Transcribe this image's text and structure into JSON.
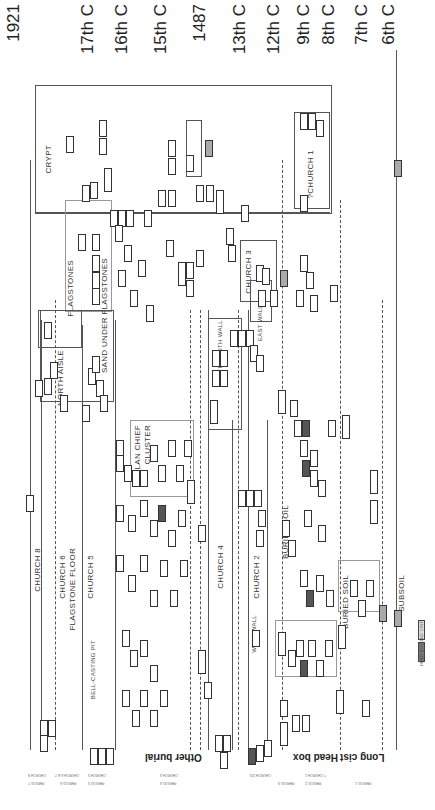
{
  "diagram": {
    "type": "harris-matrix-stratigraphic",
    "orientation": "rotated-90"
  },
  "date_axis": [
    {
      "label": "1921",
      "x": 12
    },
    {
      "label": "17th C",
      "x": 84
    },
    {
      "label": "16th C",
      "x": 118
    },
    {
      "label": "15th C",
      "x": 157
    },
    {
      "label": "1487",
      "x": 196
    },
    {
      "label": "13th C",
      "x": 236
    },
    {
      "label": "12th C",
      "x": 270
    },
    {
      "label": "9th C",
      "x": 300
    },
    {
      "label": "8th C",
      "x": 325
    },
    {
      "label": "7th C",
      "x": 358
    },
    {
      "label": "6th C",
      "x": 385
    }
  ],
  "phases": {
    "crypt": "CRYPT",
    "church1": "?CHURCH 1",
    "church2": "CHURCH 2",
    "church3": "CHURCH 3",
    "church4": "CHURCH 4",
    "church5": "CHURCH 5",
    "church6": "CHURCH 6",
    "church8": "CHURCH 8",
    "flagstone_floor": "FLAGSTONE FLOOR",
    "flagstones": "FLAGSTONES",
    "sand_under_flagstones": "SAND UNDER FLAGSTONES",
    "north_aisle": "NORTH AISLE",
    "clan_chief_cluster_1": "CLAN CHIEF",
    "clan_chief_cluster_2": "CLUSTER",
    "buried_soil": "BURIED SOIL",
    "buried_soil_2": "BURIED SOIL",
    "subsoil": "SUBSOIL",
    "bell_casting_pit": "BELL-CASTING PIT",
    "west_wall": "WEST WALL",
    "north_south_wall": "NORTH SOUTH WALL",
    "east_wall": "EAST WALL"
  },
  "burial_types": {
    "other_burial": "Other burial",
    "head_box": "Head box",
    "long_cist": "Long cist"
  },
  "period_labels": {
    "row1": [
      "PERIOD 7",
      "PERIOD 6",
      "PERIOD 5",
      "PERIOD 4",
      "PERIOD 3",
      "PERIOD 2",
      "PERIOD 1"
    ],
    "row2": [
      "CHURCH 8",
      "CHURCH 6 & 7",
      "CHURCH 5",
      "CHURCH 4",
      "CHURCH 2/3",
      "? CHURCH 1"
    ]
  },
  "legend": {
    "items": [
      "LONG CIST",
      "HEAD BOX"
    ]
  }
}
